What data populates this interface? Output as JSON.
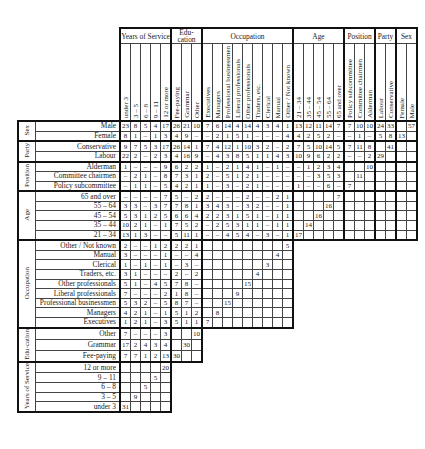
{
  "column_groups": [
    {
      "label": "Years of Service",
      "columns": [
        "under 3",
        "3 – 5",
        "6 – 8",
        "9 – 11",
        "12 or more"
      ]
    },
    {
      "label": "Edu-cation",
      "columns": [
        "Fee-paying",
        "Grammar",
        "Other"
      ]
    },
    {
      "label": "Occupation",
      "columns": [
        "Executives",
        "Managers",
        "Professional businessmen",
        "Liberal professionals",
        "Other professionals",
        "Traders, etc.",
        "Clerical",
        "Manual",
        "Other / Not known"
      ]
    },
    {
      "label": "Age",
      "columns": [
        "21 – 34",
        "35 – 44",
        "45 – 54",
        "55 – 64",
        "65 and over"
      ]
    },
    {
      "label": "Position",
      "columns": [
        "Policy subcommittee",
        "Committee chairmen",
        "Alderman"
      ]
    },
    {
      "label": "Party",
      "columns": [
        "Labour",
        "Conservative"
      ]
    },
    {
      "label": "Sex",
      "columns": [
        "Female",
        "Male"
      ]
    }
  ],
  "row_groups": [
    {
      "label": "Sex",
      "rows": [
        {
          "label": "Male",
          "cells": [
            "23",
            "8",
            "5",
            "4",
            "17",
            "26",
            "21",
            "10",
            "7",
            "6",
            "14",
            "4",
            "14",
            "4",
            "3",
            "4",
            "1",
            "13",
            "12",
            "11",
            "14",
            "7",
            "7",
            "10",
            "10",
            "24",
            "33",
            "",
            "57"
          ]
        },
        {
          "label": "Female",
          "cells": [
            "8",
            "1",
            "–",
            "1",
            "3",
            "4",
            "9",
            "–",
            "–",
            "2",
            "1",
            "5",
            "1",
            "–",
            "–",
            "–",
            "4",
            "4",
            "2",
            "5",
            "2",
            "–",
            "–",
            "1",
            "–",
            "5",
            "8",
            "13",
            ""
          ]
        }
      ]
    },
    {
      "label": "Party",
      "rows": [
        {
          "label": "Conservative",
          "cells": [
            "9",
            "7",
            "5",
            "3",
            "17",
            "26",
            "14",
            "1",
            "7",
            "4",
            "12",
            "1",
            "10",
            "3",
            "2",
            "–",
            "2",
            "7",
            "5",
            "10",
            "14",
            "5",
            "7",
            "11",
            "8",
            "",
            "41",
            "",
            ""
          ]
        },
        {
          "label": "Labour",
          "cells": [
            "22",
            "2",
            "–",
            "2",
            "3",
            "4",
            "16",
            "9",
            "–",
            "4",
            "3",
            "8",
            "5",
            "1",
            "1",
            "4",
            "3",
            "10",
            "9",
            "6",
            "2",
            "2",
            "–",
            "–",
            "2",
            "29",
            "",
            "",
            ""
          ]
        }
      ]
    },
    {
      "label": "Position",
      "rows": [
        {
          "label": "Alderman",
          "cells": [
            "1",
            "–",
            "–",
            "–",
            "9",
            "6",
            "2",
            "2",
            "1",
            "–",
            "2",
            "1",
            "4",
            "1",
            "–",
            "1",
            "–",
            "–",
            "1",
            "2",
            "3",
            "4",
            "",
            "",
            "10",
            "",
            "",
            "",
            ""
          ]
        },
        {
          "label": "Committee chairmen",
          "cells": [
            "–",
            "2",
            "1",
            "–",
            "8",
            "7",
            "3",
            "1",
            "2",
            "–",
            "5",
            "1",
            "2",
            "1",
            "–",
            "–",
            "–",
            "–",
            "–",
            "3",
            "5",
            "3",
            "",
            "11",
            "",
            "",
            "",
            "",
            ""
          ]
        },
        {
          "label": "Policy subcommittee",
          "cells": [
            "–",
            "1",
            "1",
            "–",
            "5",
            "4",
            "2",
            "1",
            "1",
            "–",
            "3",
            "–",
            "2",
            "1",
            "–",
            "–",
            "–",
            "1",
            "–",
            "–",
            "6",
            "–",
            "7",
            "",
            "",
            "",
            "",
            "",
            ""
          ]
        }
      ]
    },
    {
      "label": "Age",
      "rows": [
        {
          "label": "65 and over",
          "cells": [
            "–",
            "–",
            "–",
            "–",
            "7",
            "5",
            "–",
            "2",
            "2",
            "–",
            "–",
            "–",
            "2",
            "–",
            "–",
            "2",
            "1",
            "",
            "",
            "",
            "",
            "7",
            "",
            "",
            "",
            "",
            "",
            "",
            ""
          ]
        },
        {
          "label": "55 – 64",
          "cells": [
            "3",
            "3",
            "–",
            "3",
            "7",
            "7",
            "8",
            "1",
            "3",
            "4",
            "3",
            "–",
            "3",
            "2",
            "–",
            "–",
            "1",
            "",
            "",
            "",
            "16",
            "",
            "",
            "",
            "",
            "",
            "",
            "",
            ""
          ]
        },
        {
          "label": "45 – 54",
          "cells": [
            "5",
            "3",
            "1",
            "2",
            "5",
            "6",
            "6",
            "4",
            "2",
            "2",
            "3",
            "1",
            "5",
            "1",
            "–",
            "1",
            "1",
            "",
            "",
            "16",
            "",
            "",
            "",
            "",
            "",
            "",
            "",
            "",
            ""
          ]
        },
        {
          "label": "35 – 44",
          "cells": [
            "10",
            "2",
            "1",
            "–",
            "1",
            "7",
            "5",
            "2",
            "–",
            "2",
            "5",
            "3",
            "1",
            "1",
            "–",
            "1",
            "1",
            "",
            "14",
            "",
            "",
            "",
            "",
            "",
            "",
            "",
            "",
            "",
            ""
          ]
        },
        {
          "label": "21 – 34",
          "cells": [
            "13",
            "1",
            "3",
            "–",
            "–",
            "5",
            "11",
            "1",
            "–",
            "–",
            "4",
            "5",
            "4",
            "–",
            "3",
            "–",
            "1",
            "17",
            "",
            "",
            "",
            "",
            "",
            "",
            "",
            "",
            "",
            "",
            ""
          ]
        }
      ]
    },
    {
      "label": "Occupation",
      "rows": [
        {
          "label": "Other / Not known",
          "cells": [
            "2",
            "–",
            "–",
            "1",
            "2",
            "2",
            "2",
            "1",
            "",
            "",
            "",
            "",
            "",
            "",
            "",
            "",
            "5"
          ]
        },
        {
          "label": "Manual",
          "cells": [
            "3",
            "–",
            "–",
            "–",
            "1",
            "–",
            "–",
            "4",
            "",
            "",
            "",
            "",
            "",
            "",
            "",
            "4",
            ""
          ]
        },
        {
          "label": "Clerical",
          "cells": [
            "1",
            "–",
            "1",
            "–",
            "1",
            "–",
            "3",
            "–",
            "",
            "",
            "",
            "",
            "",
            "",
            "3",
            "",
            ""
          ]
        },
        {
          "label": "Traders, etc.",
          "cells": [
            "3",
            "1",
            "–",
            "–",
            "–",
            "2",
            "–",
            "2",
            "",
            "",
            "",
            "",
            "",
            "4",
            "",
            "",
            ""
          ]
        },
        {
          "label": "Other professionals",
          "cells": [
            "5",
            "1",
            "–",
            "4",
            "5",
            "7",
            "8",
            "–",
            "",
            "",
            "",
            "",
            "15",
            "",
            "",
            "",
            ""
          ]
        },
        {
          "label": "Liberal professionals",
          "cells": [
            "7",
            "–",
            "–",
            "–",
            "2",
            "1",
            "8",
            "–",
            "",
            "",
            "",
            "9",
            "",
            "",
            "",
            "",
            ""
          ]
        },
        {
          "label": "Professional businessmen",
          "cells": [
            "5",
            "3",
            "2",
            "–",
            "5",
            "8",
            "7",
            "–",
            "",
            "",
            "15",
            "",
            "",
            "",
            "",
            "",
            ""
          ]
        },
        {
          "label": "Managers",
          "cells": [
            "4",
            "2",
            "1",
            "–",
            "1",
            "5",
            "1",
            "2",
            "",
            "8",
            "",
            "",
            "",
            "",
            "",
            "",
            ""
          ]
        },
        {
          "label": "Executives",
          "cells": [
            "1",
            "2",
            "1",
            "–",
            "3",
            "5",
            "1",
            "1",
            "7",
            "",
            "",
            "",
            "",
            "",
            "",
            "",
            ""
          ]
        }
      ]
    },
    {
      "label": "Edu-cation",
      "rows": [
        {
          "label": "Other",
          "cells": [
            "7",
            "–",
            "–",
            "–",
            "3",
            "",
            "",
            "10"
          ]
        },
        {
          "label": "Grammar",
          "cells": [
            "17",
            "2",
            "4",
            "3",
            "4",
            "",
            "30",
            ""
          ]
        },
        {
          "label": "Fee-paying",
          "cells": [
            "7",
            "7",
            "1",
            "2",
            "13",
            "30",
            "",
            ""
          ]
        }
      ]
    },
    {
      "label": "Years of Service",
      "rows": [
        {
          "label": "12 or more",
          "cells": [
            "",
            "",
            "",
            "",
            "20"
          ]
        },
        {
          "label": "9 – 11",
          "cells": [
            "",
            "",
            "",
            "5",
            ""
          ]
        },
        {
          "label": "6 – 8",
          "cells": [
            "",
            "",
            "5",
            "",
            ""
          ]
        },
        {
          "label": "3 – 5",
          "cells": [
            "",
            "9",
            "",
            "",
            ""
          ]
        },
        {
          "label": "under 3",
          "cells": [
            "31",
            "",
            "",
            "",
            ""
          ]
        }
      ]
    }
  ],
  "grammar_marker": "•"
}
